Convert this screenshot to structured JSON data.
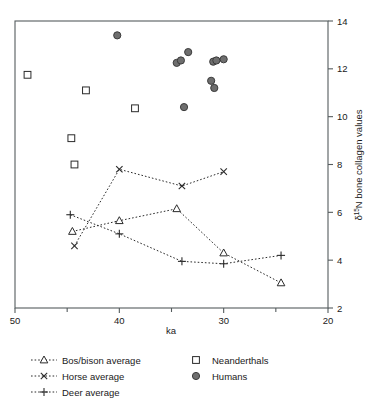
{
  "chart_data": {
    "type": "scatter",
    "title": "",
    "xlabel": "ka",
    "ylabel": "δ¹⁵N bone collagen values",
    "ylabel_parts": {
      "delta": "δ",
      "superscript": "15",
      "rest": "N bone collagen values"
    },
    "xlim": [
      50,
      20
    ],
    "ylim": [
      2,
      14
    ],
    "x_reversed": true,
    "x_ticks": [
      50,
      40,
      30,
      20
    ],
    "x_minor_ticks": [
      45,
      35,
      25
    ],
    "y_ticks": [
      2,
      4,
      6,
      8,
      10,
      12,
      14
    ],
    "y_axis_position": "right",
    "grid": false,
    "legend_position": "below",
    "series": [
      {
        "name": "Bos/bison average",
        "marker": "triangle-open",
        "line": "dotted",
        "points": [
          {
            "x": 44.5,
            "y": 5.2
          },
          {
            "x": 40.0,
            "y": 5.65
          },
          {
            "x": 34.5,
            "y": 6.15
          },
          {
            "x": 30.0,
            "y": 4.3
          },
          {
            "x": 24.5,
            "y": 3.05
          }
        ]
      },
      {
        "name": "Horse average",
        "marker": "cross-x",
        "line": "dotted",
        "points": [
          {
            "x": 44.3,
            "y": 4.6
          },
          {
            "x": 40.0,
            "y": 7.8
          },
          {
            "x": 34.0,
            "y": 7.1
          },
          {
            "x": 30.0,
            "y": 7.7
          }
        ]
      },
      {
        "name": "Deer average",
        "marker": "plus",
        "line": "dotted",
        "points": [
          {
            "x": 44.7,
            "y": 5.9
          },
          {
            "x": 40.0,
            "y": 5.1
          },
          {
            "x": 34.0,
            "y": 3.95
          },
          {
            "x": 30.0,
            "y": 3.85
          },
          {
            "x": 24.5,
            "y": 4.2
          }
        ]
      },
      {
        "name": "Neanderthals",
        "marker": "square-open",
        "line": "none",
        "points": [
          {
            "x": 48.8,
            "y": 11.75
          },
          {
            "x": 43.2,
            "y": 11.1
          },
          {
            "x": 38.5,
            "y": 10.35
          },
          {
            "x": 44.6,
            "y": 9.1
          },
          {
            "x": 44.3,
            "y": 8.0
          }
        ]
      },
      {
        "name": "Humans",
        "marker": "circle-filled",
        "line": "none",
        "points": [
          {
            "x": 40.2,
            "y": 13.4
          },
          {
            "x": 34.5,
            "y": 12.25
          },
          {
            "x": 34.1,
            "y": 12.35
          },
          {
            "x": 33.4,
            "y": 12.7
          },
          {
            "x": 31.0,
            "y": 12.3
          },
          {
            "x": 30.7,
            "y": 12.35
          },
          {
            "x": 30.0,
            "y": 12.4
          },
          {
            "x": 31.2,
            "y": 11.5
          },
          {
            "x": 30.9,
            "y": 11.2
          },
          {
            "x": 33.8,
            "y": 10.4
          }
        ]
      }
    ],
    "colors": {
      "axis": "#555c5e",
      "line": "#2b2b2b",
      "marker_open_fill": "#ffffff",
      "marker_filled": "#6e6e6e",
      "text": "#1a1a1a"
    }
  },
  "legend": {
    "entries": [
      {
        "label": "Bos/bison average",
        "marker": "triangle-open",
        "column": 0
      },
      {
        "label": "Horse average",
        "marker": "cross-x",
        "column": 0
      },
      {
        "label": "Deer average",
        "marker": "plus",
        "column": 0
      },
      {
        "label": "Neanderthals",
        "marker": "square-open",
        "column": 1
      },
      {
        "label": "Humans",
        "marker": "circle-filled",
        "column": 1
      }
    ]
  }
}
